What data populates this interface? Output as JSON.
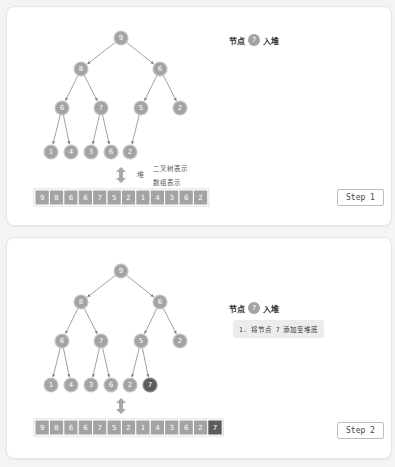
{
  "panels": [
    {
      "title_prefix": "节点",
      "title_node": "7",
      "title_suffix": "入堆",
      "note": "",
      "step_label": "Step 1",
      "tree_nodes": [
        "9",
        "8",
        "6",
        "6",
        "7",
        "5",
        "2",
        "1",
        "4",
        "3",
        "6",
        "2"
      ],
      "highlight_index": -1,
      "array": [
        "9",
        "8",
        "6",
        "6",
        "7",
        "5",
        "2",
        "1",
        "4",
        "3",
        "6",
        "2"
      ],
      "heap_label": "堆",
      "tree_repr_label": "二叉树表示",
      "array_repr_label": "数组表示"
    },
    {
      "title_prefix": "节点",
      "title_node": "7",
      "title_suffix": "入堆",
      "note": "1. 将节点 7 添加至堆底",
      "step_label": "Step 2",
      "tree_nodes": [
        "9",
        "8",
        "6",
        "6",
        "7",
        "5",
        "2",
        "1",
        "4",
        "3",
        "6",
        "2",
        "7"
      ],
      "highlight_index": 12,
      "array": [
        "9",
        "8",
        "6",
        "6",
        "7",
        "5",
        "2",
        "1",
        "4",
        "3",
        "6",
        "2",
        "7"
      ],
      "heap_label": "",
      "tree_repr_label": "",
      "array_repr_label": ""
    }
  ],
  "colors": {
    "node": "#a3a3a3",
    "node_highlight": "#5c5c5c",
    "edge": "#7a7a7a"
  }
}
